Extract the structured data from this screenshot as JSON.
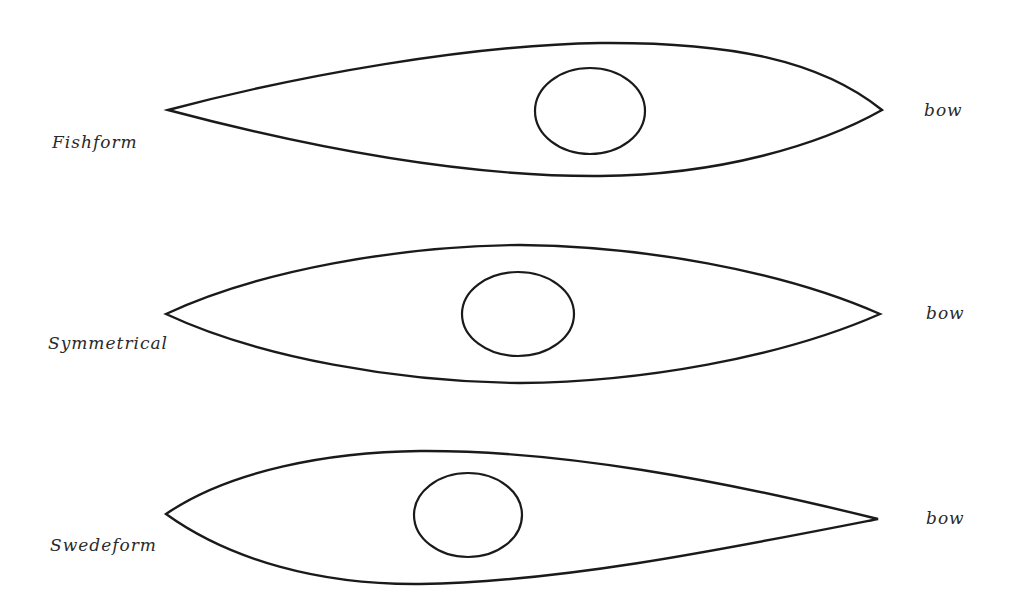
{
  "diagram": {
    "stroke_color": "#1a1a1a",
    "label_color": "#2a2a2a",
    "background": "#ffffff",
    "shapes": [
      {
        "name": "Fishform",
        "label": "Fishform",
        "bow_label": "bow",
        "description": "Widest point forward of center, toward the bow"
      },
      {
        "name": "Symmetrical",
        "label": "Symmetrical",
        "bow_label": "bow",
        "description": "Widest point at center"
      },
      {
        "name": "Swedeform",
        "label": "Swedeform",
        "bow_label": "bow",
        "description": "Widest point aft of center, toward the stern"
      }
    ]
  }
}
